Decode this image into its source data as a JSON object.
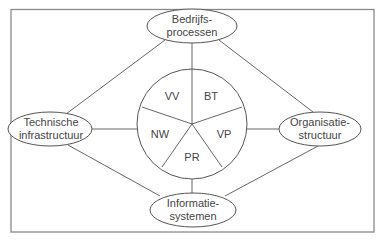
{
  "diagram": {
    "nodes": {
      "top": {
        "line1": "Bedrijfs-",
        "line2": "processen"
      },
      "left": {
        "line1": "Technische",
        "line2": "infrastructuur"
      },
      "right": {
        "line1": "Organisatie-",
        "line2": "structuur"
      },
      "bottom": {
        "line1": "Informatie-",
        "line2": "systemen"
      }
    },
    "center_segments": [
      "VV",
      "BT",
      "VP",
      "PR",
      "NW"
    ]
  }
}
